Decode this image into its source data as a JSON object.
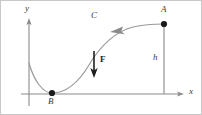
{
  "figure": {
    "width": 202,
    "height": 115,
    "background_color": "#ffffff",
    "border_color": "#c8c8c8",
    "axis_color": "#8a8a8a",
    "curve_color": "#9a9a9a",
    "point_color": "#1a1a1a",
    "force_color": "#1e1e1e",
    "label_color": "#3a3a3a"
  },
  "axes": {
    "y_label": "y",
    "x_label": "x",
    "origin_x": 28,
    "origin_y": 93,
    "y_axis_top": 17,
    "y_axis_bottom": 105,
    "x_axis_left": 20,
    "x_axis_right": 183
  },
  "points": [
    {
      "label": "A",
      "x": 163,
      "y": 23,
      "label_x": 160,
      "label_y": 5
    },
    {
      "label": "B",
      "x": 51,
      "y": 92,
      "label_x": 47,
      "label_y": 96
    }
  ],
  "curve": {
    "label": "C",
    "label_x": 90,
    "label_y": 11,
    "path": "M 28,62 C 33,80 42,92 51,92 C 63,92 76,84 88,64 C 99,45 115,30 132,26 C 145,23 156,23 163,23",
    "direction_arrow": {
      "name": "curve-direction-arrow",
      "x": 112,
      "y": 29,
      "points": "112,29 123,26 121,30.5 124,33.5"
    }
  },
  "height_segment": {
    "label": "h",
    "label_x": 152,
    "label_y": 53,
    "from_x": 163,
    "from_y": 25,
    "to_x": 163,
    "to_y": 93
  },
  "force_vector": {
    "label": "F",
    "label_x": 98,
    "label_y": 55,
    "from_x": 93,
    "from_y": 50,
    "to_x": 93,
    "to_y": 76
  }
}
